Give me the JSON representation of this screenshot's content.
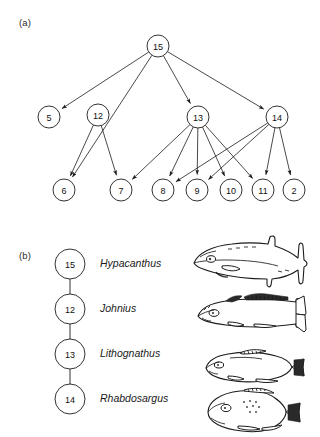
{
  "figure": {
    "panel_a_label": "(a)",
    "panel_b_label": "(b)"
  },
  "graph": {
    "nodes": [
      {
        "id": "15",
        "label": "15",
        "x": 158,
        "y": 46
      },
      {
        "id": "5",
        "label": "5",
        "x": 49,
        "y": 117
      },
      {
        "id": "12",
        "label": "12",
        "x": 98,
        "y": 115
      },
      {
        "id": "13",
        "label": "13",
        "x": 198,
        "y": 117
      },
      {
        "id": "14",
        "label": "14",
        "x": 277,
        "y": 117
      },
      {
        "id": "6",
        "label": "6",
        "x": 64,
        "y": 190
      },
      {
        "id": "7",
        "label": "7",
        "x": 121,
        "y": 190
      },
      {
        "id": "8",
        "label": "8",
        "x": 163,
        "y": 190
      },
      {
        "id": "9",
        "label": "9",
        "x": 197,
        "y": 190
      },
      {
        "id": "10",
        "label": "10",
        "x": 231,
        "y": 190
      },
      {
        "id": "11",
        "label": "11",
        "x": 263,
        "y": 190
      },
      {
        "id": "2",
        "label": "2",
        "x": 294,
        "y": 190
      }
    ],
    "edges": [
      {
        "from": "15",
        "to": "5"
      },
      {
        "from": "15",
        "to": "6"
      },
      {
        "from": "15",
        "to": "13"
      },
      {
        "from": "15",
        "to": "14"
      },
      {
        "from": "12",
        "to": "6"
      },
      {
        "from": "12",
        "to": "7"
      },
      {
        "from": "13",
        "to": "7"
      },
      {
        "from": "13",
        "to": "8"
      },
      {
        "from": "13",
        "to": "9"
      },
      {
        "from": "13",
        "to": "10"
      },
      {
        "from": "13",
        "to": "11"
      },
      {
        "from": "14",
        "to": "8"
      },
      {
        "from": "14",
        "to": "9"
      },
      {
        "from": "14",
        "to": "11"
      },
      {
        "from": "14",
        "to": "2"
      }
    ],
    "node_radius": 11
  },
  "legend": {
    "chain": [
      {
        "id": "15",
        "label": "15",
        "name": "Hypacanthus",
        "y": 264,
        "fish": "queenfish"
      },
      {
        "id": "12",
        "label": "12",
        "name": "Johnius",
        "y": 309,
        "fish": "croaker"
      },
      {
        "id": "13",
        "label": "13",
        "name": "Lithognathus",
        "y": 354,
        "fish": "steenbras"
      },
      {
        "id": "14",
        "label": "14",
        "name": "Rhabdosargus",
        "y": 399,
        "fish": "bream"
      }
    ],
    "node_x": 70,
    "node_radius": 15,
    "name_x": 100
  }
}
